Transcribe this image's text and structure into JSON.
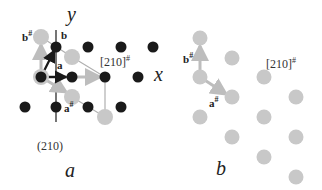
{
  "colors": {
    "black_atom": "#1a1a1a",
    "gray_atom": "#c8c8c8",
    "line_gray": "#b0b0b0",
    "arrow_gray": "#bdbdbd"
  },
  "panel_a": {
    "caption": "a",
    "axis_y_label": "y",
    "axis_x_label": "x",
    "vec_a": "a",
    "vec_b": "b",
    "vec_a_hash": "a",
    "vec_b_hash": "b",
    "hash": "#",
    "dir_label": "[210]",
    "plane_label": "(210)",
    "black_atoms": [
      [
        56,
        47
      ],
      [
        88,
        47
      ],
      [
        121,
        47
      ],
      [
        153,
        47
      ],
      [
        41,
        77
      ],
      [
        72,
        77
      ],
      [
        105,
        77
      ],
      [
        138,
        77
      ],
      [
        25,
        107
      ],
      [
        56,
        107
      ],
      [
        88,
        107
      ],
      [
        121,
        107
      ]
    ],
    "gray_atoms": [
      [
        41,
        37
      ],
      [
        72,
        57
      ],
      [
        41,
        77
      ],
      [
        72,
        97
      ],
      [
        105,
        117
      ]
    ]
  },
  "panel_b": {
    "caption": "b",
    "vec_a_hash": "a",
    "vec_b_hash": "b",
    "hash": "#",
    "dir_label": "[210]",
    "gray_atoms": [
      [
        200,
        38
      ],
      [
        232,
        58
      ],
      [
        200,
        77
      ],
      [
        264,
        77
      ],
      [
        232,
        97
      ],
      [
        296,
        97
      ],
      [
        200,
        117
      ],
      [
        264,
        117
      ],
      [
        232,
        137
      ],
      [
        296,
        137
      ],
      [
        264,
        157
      ],
      [
        296,
        177
      ]
    ]
  }
}
